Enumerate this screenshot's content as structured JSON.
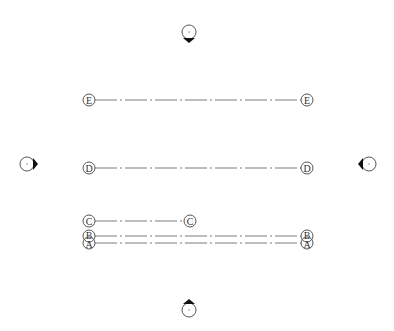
{
  "view": {
    "type": "floor-plan-grid-view",
    "background": "#ffffff"
  },
  "grids": [
    {
      "label": "E",
      "y": 100,
      "x1": 89,
      "x2": 307
    },
    {
      "label": "D",
      "y": 168,
      "x1": 89,
      "x2": 307
    },
    {
      "label": "C",
      "y": 221,
      "x1": 89,
      "x2": 190
    },
    {
      "label": "B",
      "y": 236,
      "x1": 89,
      "x2": 307
    },
    {
      "label": "A",
      "y": 243,
      "x1": 89,
      "x2": 307
    }
  ],
  "elevation_markers": [
    {
      "name": "north",
      "cx": 189,
      "cy": 32,
      "direction": "down"
    },
    {
      "name": "south",
      "cx": 189,
      "cy": 310,
      "direction": "up"
    },
    {
      "name": "west",
      "cx": 24,
      "cy": 164,
      "direction": "right"
    },
    {
      "name": "east",
      "cx": 369,
      "cy": 164,
      "direction": "left"
    }
  ],
  "colors": {
    "line": "#7a7a7a",
    "bubble_stroke": "#555555",
    "arrow": "#111111"
  }
}
